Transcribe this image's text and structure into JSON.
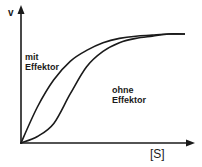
{
  "chart_data": {
    "type": "line",
    "title": "",
    "xlabel": "[S]",
    "ylabel": "v",
    "grid": false,
    "legend": "none (inline annotations)",
    "x_ticks": [],
    "y_ticks": [],
    "xlim": [
      0,
      1
    ],
    "ylim": [
      0,
      1
    ],
    "series": [
      {
        "name": "mit Effektor",
        "shape": "hyperbolic (Michaelis-Menten)",
        "x": [
          0,
          0.1,
          0.2,
          0.3,
          0.4,
          0.5,
          0.6,
          0.7,
          0.8,
          0.9,
          1.0
        ],
        "y": [
          0,
          0.33,
          0.58,
          0.75,
          0.85,
          0.92,
          0.96,
          0.98,
          0.99,
          1.0,
          1.0
        ]
      },
      {
        "name": "ohne Effektor",
        "shape": "sigmoid (allosteric)",
        "x": [
          0,
          0.1,
          0.2,
          0.3,
          0.4,
          0.5,
          0.6,
          0.7,
          0.8,
          0.9,
          1.0
        ],
        "y": [
          0,
          0.06,
          0.18,
          0.45,
          0.7,
          0.84,
          0.92,
          0.96,
          0.98,
          1.0,
          1.0
        ]
      }
    ],
    "annotations": [
      {
        "text": "mit\nEffektor",
        "near_series": "mit Effektor"
      },
      {
        "text": "ohne\nEffektor",
        "near_series": "ohne Effektor"
      }
    ]
  },
  "labels": {
    "y_axis": "v",
    "x_axis": "[S]",
    "mit_line1": "mit",
    "mit_line2": "Effektor",
    "ohne_line1": "ohne",
    "ohne_line2": "Effektor"
  },
  "colors": {
    "ink": "#1a1a1a",
    "background": "#ffffff"
  }
}
